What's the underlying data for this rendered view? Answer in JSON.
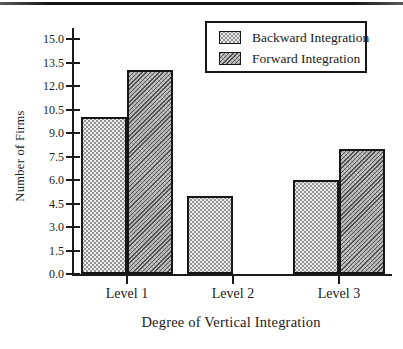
{
  "figure": {
    "background": "#ffffff",
    "top_rule_color": "#161616"
  },
  "chart_data": {
    "type": "bar",
    "title": "",
    "categories": [
      "Level 1",
      "Level 2",
      "Level 3"
    ],
    "series": [
      {
        "name": "Backward Integration",
        "values": [
          10,
          5,
          6
        ],
        "pattern": "dots",
        "fill": "#ededed",
        "dot_color": "#7d7d7d"
      },
      {
        "name": "Forward Integration",
        "values": [
          13,
          0,
          8
        ],
        "pattern": "diagonal-hatch",
        "fill": "#b0b0b0",
        "line_color": "#4f4f4f"
      }
    ],
    "xlabel": "Degree of Vertical Integration",
    "ylabel": "Number of Firms",
    "ylim": [
      0,
      15
    ],
    "ytick_step": 1.5,
    "ytick_labels": [
      "0.0",
      "1.5",
      "3.0",
      "4.5",
      "6.0",
      "7.5",
      "9.0",
      "10.5",
      "12.0",
      "13.5",
      "15.0"
    ],
    "grid": false,
    "axis_color": "#1a1a1a",
    "bar_border_color": "#161616",
    "legend": {
      "position": "top-right",
      "entries": [
        "Backward Integration",
        "Forward Integration"
      ]
    }
  }
}
